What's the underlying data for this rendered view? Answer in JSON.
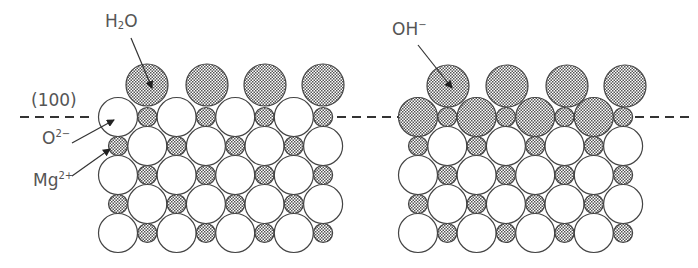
{
  "labels": {
    "water": {
      "base": "H",
      "sub": "2",
      "tail": "O"
    },
    "hydroxide": {
      "base": "OH",
      "sup": "−"
    },
    "plane": "(100)",
    "oxide": {
      "base": "O",
      "sup": "2−"
    },
    "magnesium": {
      "base": "Mg",
      "sup": "2+"
    }
  },
  "colors": {
    "stroke": "#444444",
    "fill_open": "#ffffff",
    "fill_dotted": "#cfcfcf",
    "text": "#555555"
  },
  "lattice": {
    "rows": 5,
    "row_y": [
      117,
      146,
      175,
      204,
      233
    ],
    "pitch": 29.3,
    "big_radius": 19.5,
    "small_radius": 9.5,
    "adsorbate_radius": 21,
    "left_origin_x": 118,
    "right_origin_x": 418,
    "left_adsorbate": {
      "species": "H2O",
      "y": 85,
      "x": [
        147,
        207,
        265,
        323
      ]
    },
    "right_adsorbate": {
      "species": "OH-",
      "y": 86,
      "x": [
        448,
        507,
        567,
        625
      ]
    }
  },
  "dashed_line": {
    "y": 117,
    "segments": [
      [
        20,
        95
      ],
      [
        337,
        398
      ],
      [
        635,
        690
      ]
    ]
  }
}
